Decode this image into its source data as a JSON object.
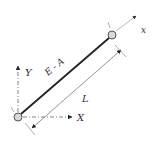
{
  "diagram": {
    "colors": {
      "bar": "#222222",
      "axis": "#555555",
      "node_fill": "#d8d8d8",
      "node_stroke": "#444444",
      "text": "#333333"
    },
    "nodes": [
      {
        "id": "i",
        "label": "i",
        "x": 18,
        "y": 117
      },
      {
        "id": "j",
        "label": "j",
        "x": 112,
        "y": 35
      }
    ],
    "bar": {
      "label": "E - A"
    },
    "local_axis": {
      "label": "x"
    },
    "global_axes": {
      "x_label": "X",
      "y_label": "Y"
    },
    "dimension": {
      "label": "L"
    }
  }
}
